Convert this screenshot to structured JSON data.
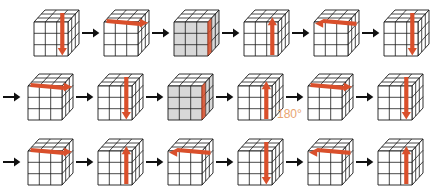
{
  "figure": {
    "annotation_180": "180°",
    "colors": {
      "cube_outline": "#1a1a1a",
      "cube_face": "#ffffff",
      "cube_shaded_face": "#d8d8d8",
      "move_arrow": "#d94f2b",
      "flow_arrow": "#111111",
      "annotation": "#e8a06a",
      "background": "#ffffff"
    },
    "rows": [
      {
        "id": "row-1",
        "has_lead_arrow": false,
        "steps": [
          {
            "name": "step-1-1",
            "arrow": "down",
            "arrow_pos": "right-column",
            "shaded": false
          },
          {
            "name": "step-1-2",
            "arrow": "right",
            "arrow_pos": "top-face",
            "shaded": false
          },
          {
            "name": "step-1-3",
            "arrow": "none",
            "arrow_pos": "edge-strip",
            "shaded": true
          },
          {
            "name": "step-1-4",
            "arrow": "up",
            "arrow_pos": "right-column",
            "shaded": false
          },
          {
            "name": "step-1-5",
            "arrow": "left",
            "arrow_pos": "top-face",
            "shaded": false
          },
          {
            "name": "step-1-6",
            "arrow": "down",
            "arrow_pos": "right-column",
            "shaded": false
          }
        ]
      },
      {
        "id": "row-2",
        "has_lead_arrow": true,
        "steps": [
          {
            "name": "step-2-1",
            "arrow": "right",
            "arrow_pos": "top-face",
            "shaded": false
          },
          {
            "name": "step-2-2",
            "arrow": "down",
            "arrow_pos": "right-column",
            "shaded": false
          },
          {
            "name": "step-2-3",
            "arrow": "none",
            "arrow_pos": "edge-strip",
            "shaded": true
          },
          {
            "name": "step-2-4",
            "arrow": "up",
            "arrow_pos": "right-column",
            "shaded": false
          },
          {
            "name": "step-2-5",
            "arrow": "right",
            "arrow_pos": "top-face",
            "shaded": false
          },
          {
            "name": "step-2-6",
            "arrow": "down",
            "arrow_pos": "right-column",
            "shaded": false
          }
        ]
      },
      {
        "id": "row-3",
        "has_lead_arrow": true,
        "steps": [
          {
            "name": "step-3-1",
            "arrow": "right",
            "arrow_pos": "top-face",
            "shaded": false
          },
          {
            "name": "step-3-2",
            "arrow": "up",
            "arrow_pos": "right-column",
            "shaded": false
          },
          {
            "name": "step-3-3",
            "arrow": "left",
            "arrow_pos": "top-face",
            "shaded": false
          },
          {
            "name": "step-3-4",
            "arrow": "down",
            "arrow_pos": "right-column",
            "shaded": false
          },
          {
            "name": "step-3-5",
            "arrow": "left",
            "arrow_pos": "top-face",
            "shaded": false
          },
          {
            "name": "step-3-6",
            "arrow": "up",
            "arrow_pos": "right-column",
            "shaded": false
          }
        ]
      }
    ]
  }
}
